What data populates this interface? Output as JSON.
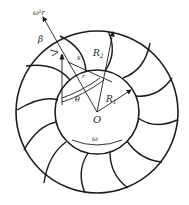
{
  "diagram": {
    "type": "impeller-blade-geometry",
    "colors": {
      "stroke": "#1c1c1c",
      "background": "#ffffff"
    },
    "labels": {
      "centripetal": "ω²r",
      "beta": "β",
      "s": "s",
      "r": "r",
      "theta": "θ",
      "R2": "R",
      "R2_sub": "2",
      "R1": "R",
      "R1_sub": "1",
      "origin": "O",
      "omega": "ω"
    },
    "outer_circle": {
      "cx": 97,
      "cy": 112,
      "r": 81
    },
    "inner_circle": {
      "cx": 97,
      "cy": 112,
      "r": 42
    },
    "blade_count": 12
  }
}
